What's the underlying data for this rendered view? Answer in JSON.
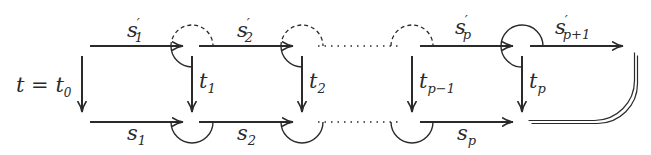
{
  "diagram": {
    "start_label": "t = t",
    "start_sub": "0",
    "top_labels": [
      {
        "base": "s",
        "prime": "′",
        "sub": "1"
      },
      {
        "base": "s",
        "prime": "′",
        "sub": "2"
      },
      {
        "base": "s",
        "prime": "′",
        "sub": "p"
      },
      {
        "base": "s",
        "prime": "′",
        "sub": "p+1"
      }
    ],
    "bottom_labels": [
      {
        "base": "s",
        "sub": "1"
      },
      {
        "base": "s",
        "sub": "2"
      },
      {
        "base": "s",
        "sub": "p"
      }
    ],
    "vertical_labels": [
      {
        "base": "t",
        "sub": "1"
      },
      {
        "base": "t",
        "sub": "2"
      },
      {
        "base": "t",
        "sub": "p−1"
      },
      {
        "base": "t",
        "sub": "p"
      }
    ],
    "stroke_color": "#2a2a2a"
  }
}
